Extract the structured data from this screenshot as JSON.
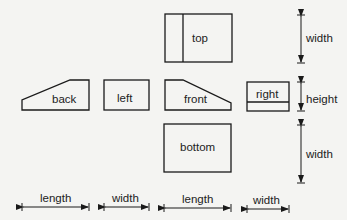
{
  "diagram": {
    "type": "orthographic-projection-views",
    "views": {
      "top": "top",
      "back": "back",
      "left": "left",
      "front": "front",
      "right": "right",
      "bottom": "bottom"
    },
    "dimensions": {
      "right_top": "width",
      "right_middle": "height",
      "right_bottom": "width",
      "bottom_1": "length",
      "bottom_2": "width",
      "bottom_3": "length",
      "bottom_4": "width"
    }
  }
}
